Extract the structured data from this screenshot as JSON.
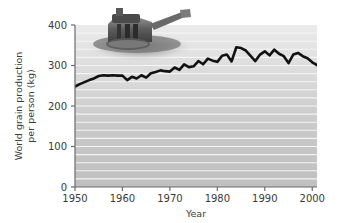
{
  "figure": {
    "background_color": "#ffffff",
    "plot_bg_top": "#e9e9e9",
    "plot_bg_bottom": "#bdbdbd",
    "gridline_color": "#f2f2f2",
    "line_color": "#111111",
    "axis_color": "#6b6b6b"
  },
  "overlay_image": {
    "name": "combine-harvester-photo",
    "alt": "grayscale photo of a combine harvester"
  },
  "chart_data": {
    "type": "line",
    "title": "",
    "xlabel": "Year",
    "ylabel": "World grain production per person (kg)",
    "ylabel_line1": "World grain production",
    "ylabel_line2": "per person (kg)",
    "xlim": [
      1950,
      2001
    ],
    "ylim": [
      0,
      400
    ],
    "yticks": [
      0,
      100,
      200,
      300,
      400
    ],
    "ytick_labels": [
      "0",
      "100",
      "200",
      "300",
      "400"
    ],
    "xticks": [
      1950,
      1960,
      1970,
      1980,
      1990,
      2000
    ],
    "xtick_labels": [
      "1950",
      "1960",
      "1970",
      "1980",
      "1990",
      "2000"
    ],
    "grid": "horizontal-minor-white",
    "gridline_values": [
      20,
      40,
      60,
      80,
      100,
      120,
      140,
      160,
      180,
      200,
      220,
      240,
      260,
      280,
      300,
      320,
      340,
      360,
      380
    ],
    "legend": "none",
    "series": [
      {
        "name": "World grain production per person",
        "x": [
          1950,
          1951,
          1952,
          1953,
          1954,
          1955,
          1956,
          1957,
          1958,
          1959,
          1960,
          1961,
          1962,
          1963,
          1964,
          1965,
          1966,
          1967,
          1968,
          1969,
          1970,
          1971,
          1972,
          1973,
          1974,
          1975,
          1976,
          1977,
          1978,
          1979,
          1980,
          1981,
          1982,
          1983,
          1984,
          1985,
          1986,
          1987,
          1988,
          1989,
          1990,
          1991,
          1992,
          1993,
          1994,
          1995,
          1996,
          1997,
          1998,
          1999,
          2000,
          2001
        ],
        "values": [
          248,
          254,
          259,
          264,
          268,
          274,
          276,
          275,
          276,
          275,
          275,
          264,
          272,
          268,
          276,
          270,
          281,
          284,
          288,
          286,
          285,
          295,
          289,
          303,
          296,
          298,
          311,
          303,
          317,
          312,
          309,
          324,
          327,
          310,
          345,
          343,
          337,
          324,
          311,
          327,
          335,
          325,
          339,
          329,
          323,
          306,
          327,
          331,
          323,
          318,
          308,
          301
        ]
      }
    ]
  }
}
